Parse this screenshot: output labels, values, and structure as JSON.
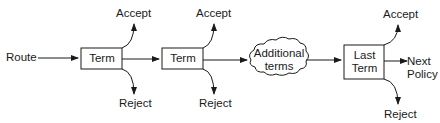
{
  "diagram": {
    "start_label": "Route",
    "nodes": [
      {
        "id": "term1",
        "label": "Term",
        "shape": "rectangle"
      },
      {
        "id": "term2",
        "label": "Term",
        "shape": "rectangle"
      },
      {
        "id": "additional",
        "label_line1": "Additional",
        "label_line2": "terms",
        "shape": "cloud"
      },
      {
        "id": "last",
        "label_line1": "Last",
        "label_line2": "Term",
        "shape": "rectangle"
      }
    ],
    "outcomes": {
      "accept": "Accept",
      "reject": "Reject",
      "next_line1": "Next",
      "next_line2": "Policy"
    },
    "colors": {
      "line": "#1a1a1a",
      "background": "#ffffff"
    }
  }
}
